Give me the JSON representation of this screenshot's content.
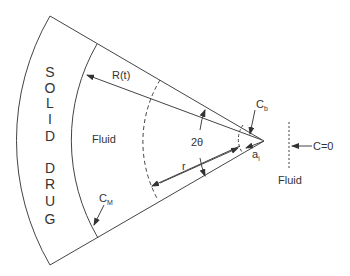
{
  "diagram": {
    "solid_letters": [
      "S",
      "O",
      "L",
      "I",
      "D",
      "D",
      "R",
      "U",
      "G"
    ],
    "labels": {
      "radius": "R(t)",
      "fluid_inner": "Fluid",
      "angle": "2θ",
      "r": "r",
      "cb_main": "C",
      "cb_sub": "b",
      "cm_main": "C",
      "cm_sub": "M",
      "ai_main": "a",
      "ai_sub": "i",
      "c0": "C=0",
      "fluid_outer": "Fluid"
    }
  }
}
